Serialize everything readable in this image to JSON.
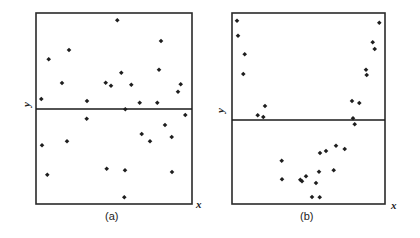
{
  "chart_data": [
    {
      "type": "scatter",
      "title": "",
      "panel_label": "(a)",
      "xlabel": "x",
      "ylabel": "y",
      "grid": false,
      "legend": null,
      "frame": {
        "x0": 36,
        "y0": 13,
        "x1": 192,
        "y1": 204
      },
      "reference_line_y": 109,
      "description": "Residuals randomly scattered about horizontal zero line (no pattern)",
      "points": [
        [
          117.3,
          20.3
        ],
        [
          161,
          41
        ],
        [
          69,
          50
        ],
        [
          48.7,
          59.3
        ],
        [
          121.3,
          72.7
        ],
        [
          159,
          69.7
        ],
        [
          62,
          83
        ],
        [
          105.7,
          82.7
        ],
        [
          111,
          85.7
        ],
        [
          131.3,
          84.7
        ],
        [
          180.7,
          84.3
        ],
        [
          178,
          91.7
        ],
        [
          41.3,
          99
        ],
        [
          87,
          101
        ],
        [
          139.7,
          102.7
        ],
        [
          157.3,
          102.7
        ],
        [
          125.3,
          109.3
        ],
        [
          185.3,
          115
        ],
        [
          86.7,
          118.7
        ],
        [
          165,
          125
        ],
        [
          141.7,
          134
        ],
        [
          171.7,
          137
        ],
        [
          67,
          141.3
        ],
        [
          150,
          141.3
        ],
        [
          42,
          145.3
        ],
        [
          106.7,
          168.7
        ],
        [
          125,
          170.3
        ],
        [
          172,
          172
        ],
        [
          47.3,
          174.7
        ],
        [
          124.3,
          197.3
        ]
      ]
    },
    {
      "type": "scatter",
      "title": "",
      "panel_label": "(b)",
      "xlabel": "x",
      "ylabel": "y",
      "grid": false,
      "legend": null,
      "frame": {
        "x0": 232,
        "y0": 13,
        "x1": 385,
        "y1": 204
      },
      "reference_line_y": 120,
      "description": "Residuals form a U-shaped (curved) pattern about horizontal line",
      "points": [
        [
          237,
          20.7
        ],
        [
          379.3,
          22.7
        ],
        [
          238,
          35.7
        ],
        [
          372.7,
          42.3
        ],
        [
          374.7,
          49
        ],
        [
          244.7,
          54.3
        ],
        [
          366,
          69.7
        ],
        [
          366.7,
          75
        ],
        [
          243.3,
          74
        ],
        [
          352,
          101
        ],
        [
          359.3,
          103
        ],
        [
          265,
          106
        ],
        [
          257.7,
          115.3
        ],
        [
          263.3,
          117
        ],
        [
          353,
          118.3
        ],
        [
          354.7,
          124.3
        ],
        [
          336,
          145.7
        ],
        [
          344.7,
          149
        ],
        [
          326,
          151
        ],
        [
          320,
          153
        ],
        [
          281.7,
          160.7
        ],
        [
          333.7,
          170.3
        ],
        [
          319,
          171.7
        ],
        [
          306,
          176.3
        ],
        [
          282,
          179.3
        ],
        [
          300.3,
          179.7
        ],
        [
          302,
          181.3
        ],
        [
          316,
          183
        ],
        [
          312,
          197
        ],
        [
          319.7,
          197.3
        ]
      ]
    }
  ],
  "labels": {
    "panel_a": "(a)",
    "panel_b": "(b)",
    "x_axis": "x",
    "y_axis": "y"
  },
  "colors": {
    "point": "#1e1e1e",
    "frame": "#2a2a2a",
    "background": "#ffffff"
  }
}
